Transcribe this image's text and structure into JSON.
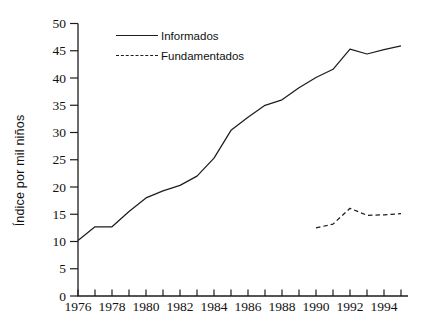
{
  "chart_data": {
    "type": "line",
    "title": "",
    "xlabel": "",
    "ylabel": "Índice por mil niños",
    "x_range": [
      1976,
      1995
    ],
    "y_range": [
      0,
      50
    ],
    "grid": false,
    "legend_position": "top-left-inside",
    "axes": {
      "y_ticks": [
        0,
        5,
        10,
        15,
        20,
        25,
        30,
        35,
        40,
        45,
        50
      ],
      "x_minor_ticks": [
        1976,
        1977,
        1978,
        1979,
        1980,
        1981,
        1982,
        1983,
        1984,
        1985,
        1986,
        1987,
        1988,
        1989,
        1990,
        1991,
        1992,
        1993,
        1994,
        1995
      ],
      "x_labeled_ticks": [
        1976,
        1978,
        1980,
        1982,
        1984,
        1986,
        1988,
        1990,
        1992,
        1994
      ]
    },
    "series": [
      {
        "name": "Informados",
        "line_style": "solid",
        "color": "#1d1d1d",
        "x": [
          1976,
          1977,
          1978,
          1979,
          1980,
          1981,
          1982,
          1983,
          1984,
          1985,
          1986,
          1987,
          1988,
          1989,
          1990,
          1991,
          1992,
          1993,
          1994,
          1995
        ],
        "values": [
          10.2,
          12.7,
          12.7,
          15.5,
          18.0,
          19.3,
          20.3,
          22.0,
          25.3,
          30.4,
          32.8,
          35.0,
          36.0,
          38.2,
          40.1,
          41.6,
          45.3,
          44.4,
          45.2,
          45.9
        ]
      },
      {
        "name": "Fundamentados",
        "line_style": "dashed",
        "color": "#1d1d1d",
        "x": [
          1990,
          1991,
          1992,
          1993,
          1994,
          1995
        ],
        "values": [
          12.5,
          13.2,
          16.1,
          14.8,
          14.9,
          15.1
        ]
      }
    ]
  },
  "colors": {
    "background": "#ffffff",
    "axis": "#1d1d1d",
    "text": "#111111"
  }
}
